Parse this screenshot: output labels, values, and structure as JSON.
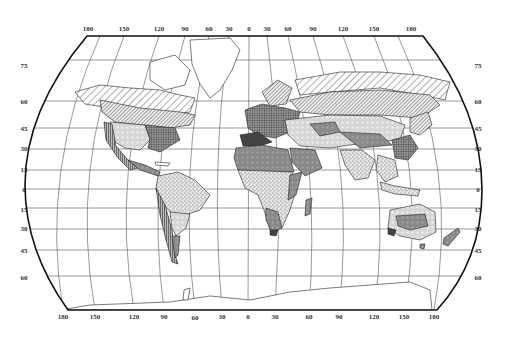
{
  "map": {
    "title": "",
    "projection": "world pseudocylindrical (Robinson-like) with graticule",
    "top_longitude_labels": [
      "180",
      "150",
      "120",
      "90",
      "60",
      "30",
      "0",
      "30",
      "60",
      "90",
      "120",
      "150",
      "180"
    ],
    "bottom_longitude_labels": [
      "180",
      "150",
      "120",
      "90",
      "60",
      "30",
      "0",
      "30",
      "60",
      "90",
      "120",
      "150",
      "180"
    ],
    "left_latitude_labels": [
      "75",
      "60",
      "45",
      "30",
      "15",
      "0",
      "15",
      "30",
      "45",
      "60"
    ],
    "right_latitude_labels": [
      "75",
      "60",
      "45",
      "30",
      "15",
      "0",
      "15",
      "30",
      "45",
      "60"
    ],
    "regions_legend": [
      {
        "pattern": "diagonal-hatch-wide",
        "description": "tundra / polar lowland"
      },
      {
        "pattern": "diagonal-hatch-dense",
        "description": "boreal forest"
      },
      {
        "pattern": "crosshatch-dark",
        "description": "temperate deciduous forest"
      },
      {
        "pattern": "light-dotted",
        "description": "steppe / grassland"
      },
      {
        "pattern": "medium-gray-dotted",
        "description": "desert"
      },
      {
        "pattern": "speckled",
        "description": "savanna / tropical"
      },
      {
        "pattern": "dark-solid",
        "description": "mediterranean"
      },
      {
        "pattern": "vertical-lines",
        "description": "mountain"
      }
    ],
    "colors": {
      "background": "#ffffff",
      "frame": "#111111",
      "grid": "#555555",
      "land_outline": "#222222",
      "dark_fill": "#444444",
      "medium_fill": "#8a8a8a",
      "light_fill": "#d6d6d6"
    }
  }
}
